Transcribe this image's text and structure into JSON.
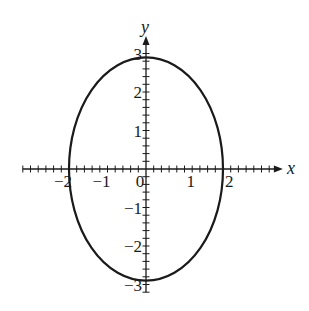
{
  "chart_data": {
    "type": "line",
    "title": "",
    "curve": {
      "shape": "ellipse",
      "center": [
        0,
        0
      ],
      "semi_axis_x": 2,
      "semi_axis_y": 2.9,
      "stroke": "#1a1a1a"
    },
    "xlabel": "x",
    "ylabel": "y",
    "x_ticks": [
      {
        "value": -2,
        "label": "−2"
      },
      {
        "value": -1,
        "label": "−1"
      },
      {
        "value": 0,
        "label": "0"
      },
      {
        "value": 1,
        "label": "1"
      },
      {
        "value": 2,
        "label": "2"
      }
    ],
    "y_ticks": [
      {
        "value": 3,
        "label": "3"
      },
      {
        "value": 2,
        "label": "2"
      },
      {
        "value": 1,
        "label": "1"
      },
      {
        "value": -1,
        "label": "−1"
      },
      {
        "value": -2,
        "label": "−2"
      },
      {
        "value": -3,
        "label": "−3"
      }
    ],
    "minor_tick_step": 0.2,
    "xlim": [
      -3.2,
      3.4
    ],
    "ylim": [
      -3.2,
      3.3
    ],
    "grid": false,
    "legend": null
  },
  "layout": {
    "origin_px": [
      146,
      169
    ],
    "unit_px": 38.5,
    "axis_color": "#1a1a1a"
  }
}
